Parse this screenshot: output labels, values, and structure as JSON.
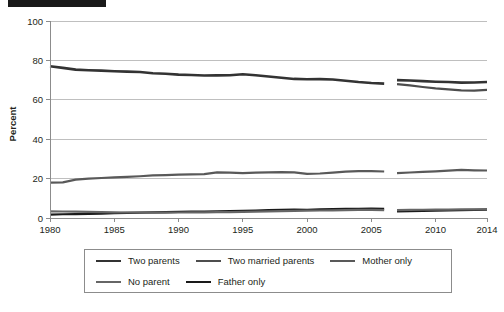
{
  "redacted_title": {
    "present": true,
    "label": "redacted-title-bar"
  },
  "chart_data": {
    "type": "line",
    "title": "",
    "xlabel": "",
    "ylabel": "Percent",
    "xlim": [
      1980,
      2014
    ],
    "ylim": [
      0,
      100
    ],
    "ytick_values": [
      0,
      20,
      40,
      60,
      80,
      100
    ],
    "ytick_labels": [
      "0",
      "20",
      "40",
      "60",
      "80",
      "100"
    ],
    "xtick_values": [
      1980,
      1985,
      1990,
      1995,
      2000,
      2005,
      2010,
      2014
    ],
    "xtick_labels": [
      "1980",
      "1985",
      "1990",
      "1995",
      "2000",
      "2005",
      "2010",
      "2014"
    ],
    "grid": "horizontal",
    "legend_position": "below",
    "series_break_note": "Series break between 2006 and 2007",
    "x": [
      1980,
      1981,
      1982,
      1983,
      1984,
      1985,
      1986,
      1987,
      1988,
      1989,
      1990,
      1991,
      1992,
      1993,
      1994,
      1995,
      1996,
      1997,
      1998,
      1999,
      2000,
      2001,
      2002,
      2003,
      2004,
      2005,
      2006,
      2007,
      2008,
      2009,
      2010,
      2011,
      2012,
      2013,
      2014
    ],
    "series": [
      {
        "name": "Two parents",
        "color": "#333333",
        "width": 2.6,
        "segments": [
          {
            "x": [
              1980,
              1981,
              1982,
              1983,
              1984,
              1985,
              1986,
              1987,
              1988,
              1989,
              1990,
              1991,
              1992,
              1993,
              1994,
              1995,
              1996,
              1997,
              1998,
              1999,
              2000,
              2001,
              2002,
              2003,
              2004,
              2005,
              2006
            ],
            "values": [
              77.0,
              76.2,
              75.3,
              75.0,
              74.8,
              74.5,
              74.3,
              74.1,
              73.5,
              73.2,
              72.8,
              72.6,
              72.3,
              72.4,
              72.5,
              73.0,
              72.5,
              71.8,
              71.2,
              70.6,
              70.4,
              70.5,
              70.3,
              69.7,
              69.0,
              68.5,
              68.2
            ]
          },
          {
            "x": [
              2007,
              2008,
              2009,
              2010,
              2011,
              2012,
              2013,
              2014
            ],
            "values": [
              70.0,
              69.8,
              69.5,
              69.2,
              69.0,
              68.7,
              68.8,
              69.0
            ]
          }
        ]
      },
      {
        "name": "Two married parents",
        "color": "#4d4d4d",
        "width": 2.2,
        "segments": [
          {
            "x": [
              2007,
              2008,
              2009,
              2010,
              2011,
              2012,
              2013,
              2014
            ],
            "values": [
              68.0,
              67.3,
              66.5,
              65.8,
              65.3,
              64.8,
              64.7,
              65.0
            ]
          }
        ]
      },
      {
        "name": "Mother only",
        "color": "#595959",
        "width": 2.2,
        "segments": [
          {
            "x": [
              1980,
              1981,
              1982,
              1983,
              1984,
              1985,
              1986,
              1987,
              1988,
              1989,
              1990,
              1991,
              1992,
              1993,
              1994,
              1995,
              1996,
              1997,
              1998,
              1999,
              2000,
              2001,
              2002,
              2003,
              2004,
              2005,
              2006
            ],
            "values": [
              18.0,
              18.1,
              19.5,
              20.0,
              20.3,
              20.6,
              20.9,
              21.2,
              21.6,
              21.8,
              22.0,
              22.1,
              22.3,
              23.2,
              23.0,
              22.8,
              23.0,
              23.2,
              23.3,
              23.2,
              22.4,
              22.6,
              23.0,
              23.5,
              23.8,
              23.8,
              23.6
            ]
          },
          {
            "x": [
              2007,
              2008,
              2009,
              2010,
              2011,
              2012,
              2013,
              2014
            ],
            "values": [
              22.8,
              23.1,
              23.4,
              23.7,
              24.0,
              24.4,
              24.2,
              24.1
            ]
          }
        ]
      },
      {
        "name": "Father only",
        "color": "#1a1a1a",
        "width": 2.2,
        "segments": [
          {
            "x": [
              1980,
              1981,
              1982,
              1983,
              1984,
              1985,
              1986,
              1987,
              1988,
              1989,
              1990,
              1991,
              1992,
              1993,
              1994,
              1995,
              1996,
              1997,
              1998,
              1999,
              2000,
              2001,
              2002,
              2003,
              2004,
              2005,
              2006
            ],
            "values": [
              1.7,
              1.9,
              2.0,
              2.1,
              2.2,
              2.4,
              2.6,
              2.7,
              2.9,
              3.0,
              3.1,
              3.2,
              3.3,
              3.4,
              3.5,
              3.6,
              3.8,
              4.0,
              4.2,
              4.3,
              4.2,
              4.4,
              4.5,
              4.6,
              4.7,
              4.8,
              4.7
            ]
          },
          {
            "x": [
              2007,
              2008,
              2009,
              2010,
              2011,
              2012,
              2013,
              2014
            ],
            "values": [
              3.3,
              3.5,
              3.6,
              3.7,
              3.9,
              4.0,
              4.1,
              4.2
            ]
          }
        ]
      },
      {
        "name": "No parent",
        "color": "#666666",
        "width": 2.2,
        "segments": [
          {
            "x": [
              1980,
              1981,
              1982,
              1983,
              1984,
              1985,
              1986,
              1987,
              1988,
              1989,
              1990,
              1991,
              1992,
              1993,
              1994,
              1995,
              1996,
              1997,
              1998,
              1999,
              2000,
              2001,
              2002,
              2003,
              2004,
              2005,
              2006
            ],
            "values": [
              3.4,
              3.3,
              3.2,
              3.1,
              3.0,
              2.9,
              2.8,
              2.8,
              2.7,
              2.7,
              2.8,
              2.9,
              2.9,
              3.0,
              3.0,
              3.1,
              3.2,
              3.4,
              3.5,
              3.6,
              3.7,
              3.8,
              3.9,
              4.0,
              4.1,
              4.1,
              4.0
            ]
          },
          {
            "x": [
              2007,
              2008,
              2009,
              2010,
              2011,
              2012,
              2013,
              2014
            ],
            "values": [
              4.0,
              4.1,
              4.2,
              4.3,
              4.3,
              4.4,
              4.4,
              4.5
            ]
          }
        ]
      }
    ],
    "legend": [
      {
        "label": "Two parents",
        "color": "#333333"
      },
      {
        "label": "Two married parents",
        "color": "#4d4d4d"
      },
      {
        "label": "Mother only",
        "color": "#595959"
      },
      {
        "label": "No parent",
        "color": "#666666"
      },
      {
        "label": "Father only",
        "color": "#1a1a1a"
      }
    ]
  }
}
